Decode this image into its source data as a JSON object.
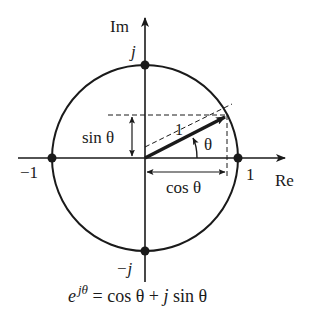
{
  "diagram": {
    "axes": {
      "imag_label": "Im",
      "real_label": "Re"
    },
    "points": {
      "top": "j",
      "bottom": "−j",
      "left": "−1",
      "right": "1"
    },
    "vector": {
      "length_label": "1",
      "angle_label": "θ"
    },
    "projections": {
      "sin_label": "sin θ",
      "cos_label": "cos θ"
    },
    "formula": {
      "base": "e",
      "exponent": "jθ",
      "rhs_1": " = cos θ + ",
      "rhs_j": "j",
      "rhs_2": " sin θ"
    },
    "colors": {
      "ink": "#1a1a1a",
      "background": "#ffffff"
    }
  }
}
